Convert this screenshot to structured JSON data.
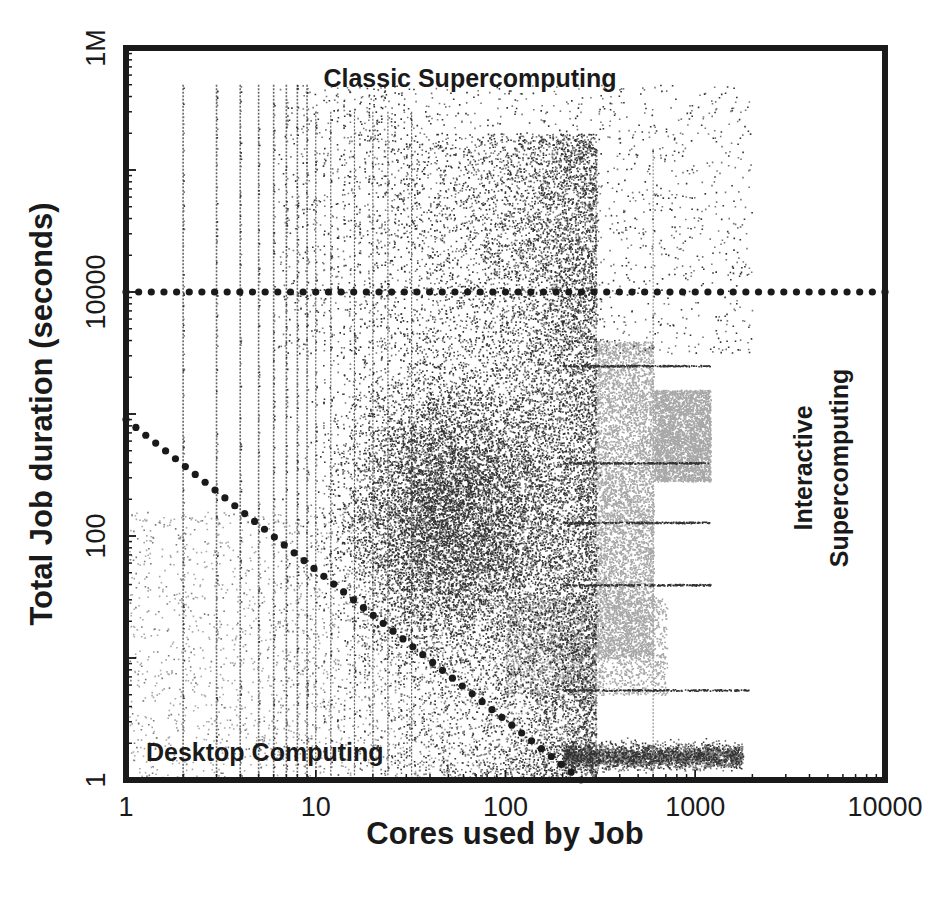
{
  "chart_data": {
    "type": "scatter",
    "title": "",
    "xlabel": "Cores used by Job",
    "ylabel": "Total Job duration (seconds)",
    "xscale": "log",
    "yscale": "log",
    "xlim": [
      1,
      10000
    ],
    "ylim": [
      1,
      1000000
    ],
    "x_ticks": [
      {
        "value": 1,
        "label": "1"
      },
      {
        "value": 10,
        "label": "10"
      },
      {
        "value": 100,
        "label": "100"
      },
      {
        "value": 1000,
        "label": "1000"
      },
      {
        "value": 10000,
        "label": "10000"
      }
    ],
    "y_ticks": [
      {
        "value": 1,
        "label": "1"
      },
      {
        "value": 100,
        "label": "100"
      },
      {
        "value": 10000,
        "label": "10000"
      },
      {
        "value": 1000000,
        "label": "1M"
      }
    ],
    "grid": false,
    "legend": null,
    "annotations": [
      {
        "id": "classic",
        "text": "Classic Supercomputing",
        "x": 0.5,
        "y": 0.965,
        "rotate": 0
      },
      {
        "id": "desktop",
        "text": "Desktop Computing",
        "x": 0.19,
        "y": 0.04,
        "rotate": 0
      },
      {
        "id": "interactive-1",
        "text": "Interactive",
        "x": 0.92,
        "y": 0.5,
        "rotate": -90
      },
      {
        "id": "interactive-2",
        "text": "Supercomputing",
        "x": 0.96,
        "y": 0.5,
        "rotate": -90
      }
    ],
    "reference_lines": [
      {
        "id": "horizontal-threshold",
        "style": "dotted",
        "from": [
          1,
          10000
        ],
        "to": [
          10000,
          10000
        ],
        "description": "Job duration ~10000 s boundary"
      },
      {
        "id": "diagonal-threshold",
        "style": "dotted",
        "from": [
          1,
          900
        ],
        "to": [
          250,
          1
        ],
        "description": "Constant core-seconds (~1000) boundary"
      }
    ],
    "series": [
      {
        "name": "Jobs (individual points)",
        "description": "Dense scatter of jobs; vertical streaks at integer core counts 1-300; densest cloud ~30-300 cores at 10-10000 s",
        "density_regions": [
          {
            "x_range": [
              2,
              300
            ],
            "y_range": [
              1,
              500000
            ],
            "density": "vertical streaks at integer core counts"
          },
          {
            "x_range": [
              20,
              300
            ],
            "y_range": [
              10,
              10000
            ],
            "density": "very high"
          },
          {
            "x_range": [
              300,
              600
            ],
            "y_range": [
              10,
              3000
            ],
            "density": "high, light grey band"
          },
          {
            "x_range": [
              600,
              1200
            ],
            "y_range": [
              300,
              1500
            ],
            "density": "high, light grey block"
          },
          {
            "x_range": [
              300,
              1500
            ],
            "y_range": [
              1.5,
              3
            ],
            "density": "horizontal band"
          },
          {
            "x_range": [
              300,
              1900
            ],
            "y_range": [
              5,
              6
            ],
            "density": "thin horizontal line"
          },
          {
            "x_range": [
              100,
              500
            ],
            "y_range": [
              5,
              20
            ],
            "density": "light grey cloud"
          }
        ],
        "horizontal_streaks_y": [
          5.5,
          40,
          130,
          400,
          2500
        ],
        "vertical_streaks_x": [
          300,
          600,
          1200
        ]
      }
    ]
  },
  "colors": {
    "axis": "#1a1a1a",
    "point_dark": "#333333",
    "point_mid": "#777777",
    "point_light": "#a8a8a8",
    "reference_dots": "#1a1a1a",
    "background": "#ffffff"
  },
  "plot_box": {
    "left": 126,
    "top": 48,
    "right": 885,
    "bottom": 780
  }
}
